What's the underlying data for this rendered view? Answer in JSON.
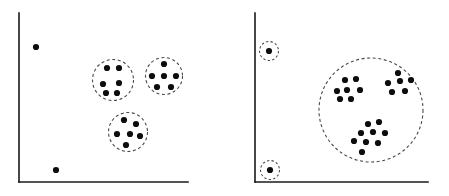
{
  "figure": {
    "title": "",
    "type": "scatter",
    "width": 449,
    "height": 196,
    "background_color": "#ffffff",
    "point_color": "#0d0d0d",
    "ring_color": "#4a4a4a",
    "axis_color": "#1a1a1a",
    "point_radius": 3.1,
    "ring_style": "dashed"
  },
  "chart_data": {
    "type": "scatter",
    "title": "",
    "xlabel": "",
    "ylabel": "",
    "grid": false,
    "legend": null,
    "panels": [
      {
        "id": "left-panel",
        "name": "fine-grained-clustering",
        "axes": {
          "x_start": 19,
          "x_end": 188,
          "y_top": 13,
          "y_bottom": 182
        },
        "clusters": [
          {
            "id": "left-cluster-a",
            "label": "",
            "circled": true,
            "center": [
              113,
              80
            ],
            "radius": 20.5,
            "points": [
              [
                107,
                68
              ],
              [
                119,
                68
              ],
              [
                103,
                84
              ],
              [
                119,
                83
              ],
              [
                106,
                93
              ],
              [
                117,
                93
              ]
            ]
          },
          {
            "id": "left-cluster-b",
            "label": "",
            "circled": true,
            "center": [
              164,
              76
            ],
            "radius": 18.5,
            "points": [
              [
                164,
                64
              ],
              [
                152,
                76
              ],
              [
                164,
                76
              ],
              [
                176,
                76
              ],
              [
                157,
                87
              ],
              [
                171,
                87
              ]
            ]
          },
          {
            "id": "left-cluster-c",
            "label": "",
            "circled": true,
            "center": [
              128,
              132
            ],
            "radius": 19.5,
            "points": [
              [
                124,
                120
              ],
              [
                136,
                124
              ],
              [
                117,
                134
              ],
              [
                130,
                134
              ],
              [
                140,
                136
              ],
              [
                126,
                145
              ]
            ]
          }
        ],
        "outliers": [
          {
            "id": "left-outlier-top",
            "circled": false,
            "point": [
              36,
              47
            ]
          },
          {
            "id": "left-outlier-bottom",
            "circled": false,
            "point": [
              56,
              170
            ]
          }
        ]
      },
      {
        "id": "right-panel",
        "name": "coarse-grained-clustering",
        "axes": {
          "x_start": 255,
          "x_end": 428,
          "y_top": 13,
          "y_bottom": 182
        },
        "clusters": [
          {
            "id": "right-cluster-main",
            "label": "",
            "circled": true,
            "center": [
              371,
              110
            ],
            "radius": 52,
            "subgroups": [
              {
                "id": "right-subgroup-upper-left",
                "points": [
                  [
                    345,
                    80
                  ],
                  [
                    356,
                    79
                  ],
                  [
                    337,
                    91
                  ],
                  [
                    347,
                    90
                  ],
                  [
                    360,
                    90
                  ],
                  [
                    340,
                    99
                  ],
                  [
                    351,
                    99
                  ]
                ]
              },
              {
                "id": "right-subgroup-upper-right",
                "points": [
                  [
                    398,
                    73
                  ],
                  [
                    388,
                    83
                  ],
                  [
                    400,
                    81
                  ],
                  [
                    411,
                    80
                  ],
                  [
                    392,
                    92
                  ],
                  [
                    405,
                    91
                  ]
                ]
              },
              {
                "id": "right-subgroup-lower",
                "points": [
                  [
                    368,
                    124
                  ],
                  [
                    379,
                    122
                  ],
                  [
                    361,
                    133
                  ],
                  [
                    373,
                    132
                  ],
                  [
                    385,
                    133
                  ],
                  [
                    354,
                    141
                  ],
                  [
                    366,
                    142
                  ],
                  [
                    378,
                    143
                  ],
                  [
                    362,
                    152
                  ]
                ]
              }
            ]
          }
        ],
        "outliers": [
          {
            "id": "right-outlier-top",
            "circled": true,
            "point": [
              269,
              51
            ],
            "radius": 9.5
          },
          {
            "id": "right-outlier-bottom",
            "circled": true,
            "point": [
              270,
              170
            ],
            "radius": 9.5
          }
        ]
      }
    ]
  }
}
